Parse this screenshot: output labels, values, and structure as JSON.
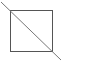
{
  "diagram": {
    "canvas": {
      "width": 94,
      "height": 66,
      "background": "#ffffff"
    },
    "square": {
      "x": 10,
      "y": 10,
      "width": 42,
      "height": 41,
      "stroke": "#555555",
      "stroke_width": 1
    },
    "diagonal_line": {
      "x1": 1,
      "y1": 2,
      "x2": 61,
      "y2": 60,
      "stroke": "#777777",
      "stroke_width": 1
    }
  }
}
